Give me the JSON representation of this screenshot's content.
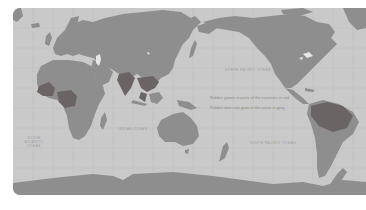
{
  "map": {
    "title": "World rubber growing regions",
    "projection": "Pacific-centered world map",
    "colors": {
      "ocean": "#c9c9c9",
      "land": "#8e8e8e",
      "highlight": "#6a6464",
      "gridline": "#bdbdbd",
      "lake": "#e6e6e6",
      "background": "#ffffff"
    },
    "legend": {
      "line1": "Rubber grown in parts of the countries in red",
      "line2": "Rubber does not grow in the areas in grey"
    },
    "ocean_labels": {
      "indian": "Indian Ocean",
      "pacific_north": "North Pacific Ocean",
      "pacific_south": "South Pacific Ocean",
      "atlantic_south": "South Atlantic Ocean",
      "atlantic_north": "North Atlantic"
    },
    "highlighted_regions": [
      "West Africa",
      "Central Africa",
      "India",
      "Southeast Asia",
      "Indonesia",
      "Brazil / Amazon"
    ]
  }
}
